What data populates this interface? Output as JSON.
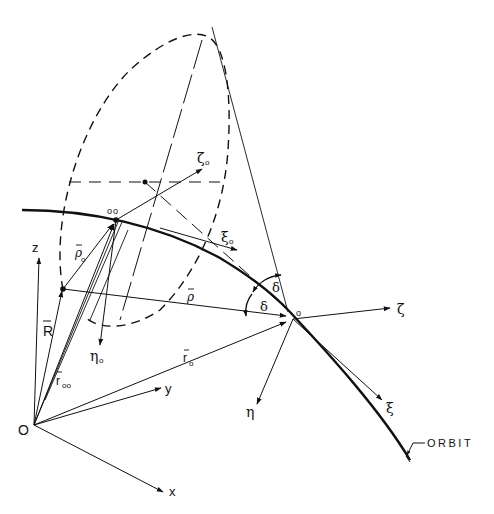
{
  "diagram": {
    "labels": {
      "origin": "O",
      "z_axis": "z",
      "y_axis": "y",
      "x_axis": "x",
      "R_vec": "R",
      "r_oo": "r",
      "r_oo_sub": "oo",
      "r_o": "r",
      "r_o_sub": "o",
      "rho_o": "ρ",
      "rho_o_sub": "o",
      "rho": "ρ",
      "eta_o": "η",
      "eta_o_sub": "o",
      "zeta_o": "ζ",
      "zeta_o_sub": "o",
      "xi_o": "ξ",
      "xi_o_sub": "o",
      "point_oo": "oo",
      "point_o": "o",
      "delta_1": "δ",
      "delta_2": "δ",
      "zeta": "ζ",
      "eta": "η",
      "xi": "ξ",
      "orbit": "ORBIT"
    },
    "colors": {
      "ink": "#111111",
      "background": "#ffffff"
    }
  }
}
